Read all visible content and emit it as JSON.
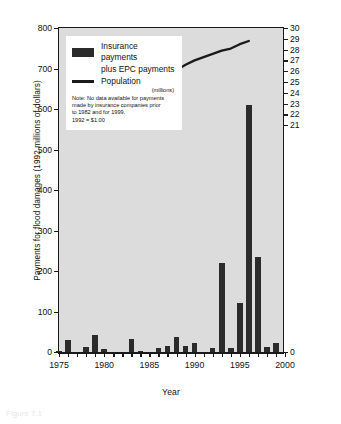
{
  "figure": {
    "caption": "Figure 7.1"
  },
  "axes": {
    "y_left_title": "Payments for flood damages (1992 millions of dollars)",
    "y_right_title": "Canada's population (millions of people)",
    "x_title": "Year"
  },
  "legend": {
    "bar_label_line1": "Insurance payments",
    "bar_label_line2": "plus EPC payments",
    "line_label": "Population",
    "line_units": "(millions)",
    "note_lines": [
      "Note: No data available for payments",
      "made by insurance companies prior",
      "to 1982 and for 1999.",
      "1992 = $1.00"
    ]
  },
  "colors": {
    "plot_background": "#dcdcdc",
    "bar": "#2b2b2b",
    "line": "#1a1a1a",
    "axis": "#1a1a1a",
    "page_background": "#ffffff"
  },
  "chart_data": {
    "type": "bar",
    "title": "",
    "xlabel": "Year",
    "ylabel": "Payments for flood damages (1992 millions of dollars)",
    "y2label": "Canada's population (millions of people)",
    "xlim": [
      1975,
      2000
    ],
    "ylim": [
      0,
      800
    ],
    "y2lim": [
      0,
      30
    ],
    "grid": false,
    "legend_position": "top-left",
    "y_ticks": [
      0,
      100,
      200,
      300,
      400,
      500,
      600,
      700,
      800
    ],
    "y2_ticks": [
      0,
      21,
      22,
      23,
      24,
      25,
      26,
      27,
      28,
      29,
      30
    ],
    "x_ticks": [
      1975,
      1980,
      1985,
      1990,
      1995,
      2000
    ],
    "x_tick_labels": [
      "1975",
      "1980",
      "1985",
      "1990",
      "1995",
      "2000"
    ],
    "x_minor_step": 1,
    "series": [
      {
        "name": "Insurance payments plus EPC payments",
        "type": "bar",
        "axis": "left",
        "x": [
          1975,
          1976,
          1977,
          1978,
          1979,
          1980,
          1981,
          1982,
          1983,
          1984,
          1985,
          1986,
          1987,
          1988,
          1989,
          1990,
          1991,
          1992,
          1993,
          1994,
          1995,
          1996,
          1997,
          1998,
          1999
        ],
        "values": [
          3,
          30,
          0,
          13,
          42,
          8,
          0,
          0,
          33,
          3,
          0,
          11,
          14,
          37,
          16,
          22,
          0,
          9,
          220,
          11,
          120,
          610,
          235,
          13,
          22
        ]
      },
      {
        "name": "Population",
        "type": "line",
        "axis": "right",
        "units": "millions",
        "x": [
          1976,
          1977,
          1978,
          1979,
          1980,
          1981,
          1982,
          1983,
          1984,
          1985,
          1986,
          1987,
          1988,
          1989,
          1990,
          1991,
          1992,
          1993,
          1994,
          1995,
          1996
        ],
        "values": [
          23.0,
          23.2,
          23.5,
          23.7,
          24.0,
          24.3,
          24.5,
          24.7,
          24.9,
          25.1,
          25.3,
          25.6,
          26.1,
          26.6,
          27.0,
          27.3,
          27.6,
          27.9,
          28.1,
          28.5,
          28.8
        ]
      }
    ]
  }
}
